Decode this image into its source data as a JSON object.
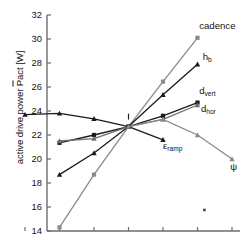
{
  "chart_data": {
    "type": "line",
    "title": "",
    "xlabel": "",
    "ylabel": "active drive power Pact [W]",
    "ylabel_overline": "P",
    "ylabel_prefix": "active drive power ",
    "ylabel_suffix": "act [W]",
    "ylim": [
      14,
      32
    ],
    "yticks": [
      14,
      16,
      18,
      20,
      22,
      24,
      26,
      28,
      30,
      32
    ],
    "ytick_labels": [
      "14",
      "16",
      "18",
      "20",
      "22",
      "24",
      "26",
      "28",
      "30",
      "32"
    ],
    "xlim": [
      0,
      7
    ],
    "xticks": [
      1,
      2,
      3,
      4,
      5,
      6,
      7
    ],
    "xtick_labels": [
      "",
      "",
      "",
      "",
      "",
      "",
      ""
    ],
    "grid": false,
    "legend_position": "inline-annotations",
    "crossing_point": {
      "x": 4,
      "y": 22.7,
      "label": "I"
    },
    "annotation_dot": {
      "x": 6.2,
      "y": 15.75
    },
    "series": [
      {
        "name": "cadence",
        "label": "cadence",
        "color": "#8a8a8a",
        "marker": "square",
        "x": [
          2,
          3,
          4,
          5,
          6
        ],
        "values": [
          14.3,
          18.7,
          22.7,
          26.45,
          30.1
        ],
        "label_xy": [
          6.05,
          31.1
        ]
      },
      {
        "name": "h_b",
        "label": "h",
        "label_sub": "b",
        "color": "#1a1a1a",
        "marker": "triangle",
        "x": [
          2,
          3,
          4,
          5,
          6
        ],
        "values": [
          18.7,
          20.5,
          22.7,
          25.35,
          27.9
        ],
        "label_xy": [
          6.15,
          28.5
        ]
      },
      {
        "name": "d_vert",
        "label": "d",
        "label_sub": "vert",
        "color": "#1a1a1a",
        "marker": "square",
        "x": [
          2,
          3,
          4,
          5,
          6
        ],
        "values": [
          21.35,
          22.0,
          22.7,
          23.6,
          24.7
        ],
        "label_xy": [
          6.05,
          25.65
        ]
      },
      {
        "name": "d_hor",
        "label": "d",
        "label_sub": "hor",
        "color": "#6e6e6e",
        "marker": "triangle",
        "x": [
          2,
          3,
          4,
          5,
          6
        ],
        "values": [
          21.5,
          21.7,
          22.7,
          23.3,
          24.5
        ],
        "label_xy": [
          6.1,
          24.15
        ]
      },
      {
        "name": "eps_ramp",
        "label": "ε",
        "label_sub": "ramp",
        "color": "#1a1a1a",
        "marker": "triangle",
        "x": [
          1,
          2,
          3,
          4,
          5
        ],
        "values": [
          23.7,
          23.8,
          23.35,
          22.7,
          21.6
        ],
        "label_xy": [
          5.0,
          21.1
        ]
      },
      {
        "name": "psi",
        "label": "ψ",
        "color": "#8a8a8a",
        "marker": "triangle",
        "x": [
          4,
          5,
          6,
          7
        ],
        "values": [
          22.7,
          23.3,
          22.0,
          20.0
        ],
        "label_xy": [
          6.95,
          19.3
        ]
      }
    ]
  },
  "axis": {
    "y_axis_name": "y-axis",
    "x_axis_name": "x-axis"
  }
}
